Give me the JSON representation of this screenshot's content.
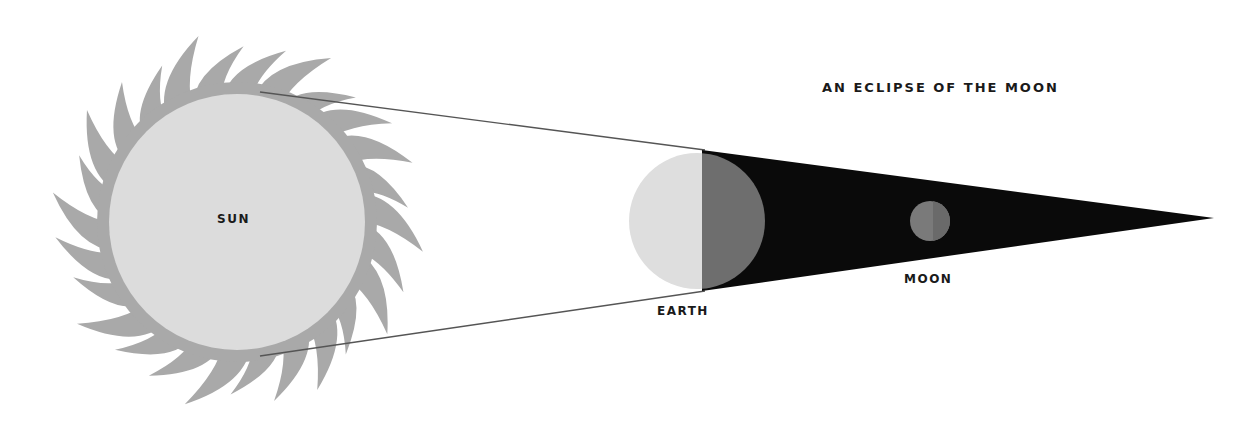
{
  "title": "AN ECLIPSE OF THE MOON",
  "labels": {
    "sun": "SUN",
    "earth": "EARTH",
    "moon": "MOON"
  },
  "colors": {
    "background": "#ffffff",
    "sun_rays": "#a9a9a9",
    "sun_disc": "#dcdcdc",
    "earth_lit": "#dedede",
    "earth_dark": "#6e6e6e",
    "shadow_cone": "#0a0a0a",
    "moon": "#7a7a7a",
    "sight_lines": "#555555",
    "text": "#1a1a1a"
  },
  "geometry": {
    "sun": {
      "cx": 237,
      "cy": 222,
      "r": 128,
      "ray_count": 26,
      "ray_length": 62
    },
    "earth": {
      "cx": 697,
      "cy": 221,
      "r": 68
    },
    "moon": {
      "cx": 930,
      "cy": 221,
      "r": 20
    },
    "shadow_tip": {
      "x": 1214,
      "y": 218
    }
  }
}
